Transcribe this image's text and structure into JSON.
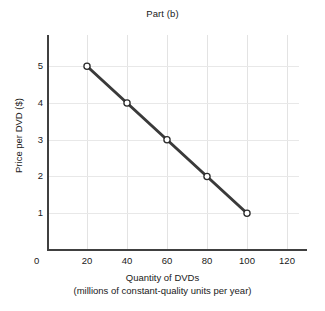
{
  "chart_data": {
    "type": "line",
    "title": "Part (b)",
    "xlabel": "Quantity of DVDs",
    "xlabel_line2": "(millions of constant-quality units per year)",
    "ylabel": "Price per DVD ($)",
    "xlim": [
      0,
      130
    ],
    "ylim": [
      0,
      5.85
    ],
    "xticks": [
      0,
      20,
      40,
      60,
      80,
      100,
      120
    ],
    "xtick_labels": [
      "0",
      "20",
      "40",
      "60",
      "80",
      "100",
      "120"
    ],
    "yticks": [
      1,
      2,
      3,
      4,
      5
    ],
    "ytick_labels": [
      "1",
      "2",
      "3",
      "4",
      "5"
    ],
    "origin_label": "0",
    "grid": true,
    "grid_color": "#e3e3e3",
    "legend": null,
    "series": [
      {
        "name": "Demand",
        "x": [
          20,
          40,
          60,
          80,
          100
        ],
        "y": [
          5,
          4,
          3,
          2,
          1
        ],
        "line_color": "#3a3a3a",
        "line_width": 3,
        "marker": "open-circle",
        "marker_face_color": "#ffffff",
        "marker_edge_color": "#2b2b2b",
        "points": [
          {
            "x": 20,
            "y": 5
          },
          {
            "x": 40,
            "y": 4
          },
          {
            "x": 60,
            "y": 3
          },
          {
            "x": 80,
            "y": 2
          },
          {
            "x": 100,
            "y": 1
          }
        ]
      }
    ],
    "axis_color": "#404040",
    "background_color": "#ffffff"
  }
}
